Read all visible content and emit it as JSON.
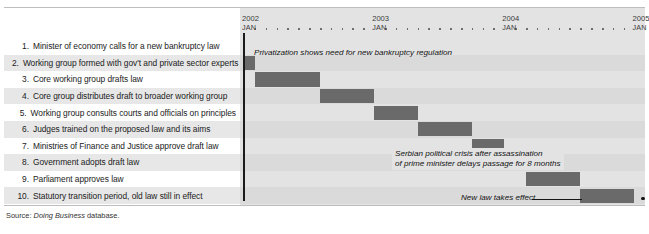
{
  "figure": {
    "source_prefix": "Source:",
    "source_italic": "Doing Business",
    "source_suffix": "database."
  },
  "steps": [
    {
      "num": "1.",
      "label": "Minister of economy calls for a new bankruptcy law"
    },
    {
      "num": "2.",
      "label": "Working group formed with gov't and private sector experts"
    },
    {
      "num": "3.",
      "label": "Core working group drafts law"
    },
    {
      "num": "4.",
      "label": "Core group distributes draft to broader working group"
    },
    {
      "num": "5.",
      "label": "Working group consults courts and officials on principles"
    },
    {
      "num": "6.",
      "label": "Judges trained on the proposed law and its aims"
    },
    {
      "num": "7.",
      "label": "Ministries of Finance and Justice approve draft law"
    },
    {
      "num": "8.",
      "label": "Government adopts draft law"
    },
    {
      "num": "9.",
      "label": "Parliament approves law"
    },
    {
      "num": "10.",
      "label": "Statutory transition period, old law still in effect"
    }
  ],
  "timeline": {
    "years": [
      {
        "year": "2002",
        "month": "JAN"
      },
      {
        "year": "2003",
        "month": "JAN"
      },
      {
        "year": "2004",
        "month": "JAN"
      },
      {
        "year": "2005",
        "month": "JAN"
      }
    ]
  },
  "annotations": {
    "privatization": "Privatization shows need for new bankruptcy regulation",
    "crisis_line1": "Serbian political crisis after assassination",
    "crisis_line2": "of prime minister delays passage for 8 months",
    "new_law": "New law takes effect"
  },
  "chart_data": {
    "type": "bar",
    "title": "",
    "subtype": "gantt",
    "xlabel": "",
    "ylabel": "",
    "grid": false,
    "legend": "none",
    "xlim": [
      "2002-01",
      "2005-01"
    ],
    "bar_color": "#6a6a6a",
    "categories": [
      "1. Minister of economy calls for a new bankruptcy law",
      "2. Working group formed with gov't and private sector experts",
      "3. Core working group drafts law",
      "4. Core group distributes draft to broader working group",
      "5. Working group consults courts and officials on principles",
      "6. Judges trained on the proposed law and its aims",
      "7. Ministries of Finance and Justice approve draft law",
      "8. Government adopts draft law",
      "9. Parliament approves law",
      "10. Statutory transition period, old law still in effect"
    ],
    "bars": [
      {
        "row": 1,
        "start_month": 0,
        "end_month": 0,
        "visible": false
      },
      {
        "row": 2,
        "start_month": 0,
        "end_month": 1,
        "visible": true
      },
      {
        "row": 3,
        "start_month": 1,
        "end_month": 7,
        "visible": true
      },
      {
        "row": 4,
        "start_month": 7,
        "end_month": 12,
        "visible": true
      },
      {
        "row": 5,
        "start_month": 12,
        "end_month": 16,
        "visible": true
      },
      {
        "row": 6,
        "start_month": 16,
        "end_month": 21,
        "visible": true
      },
      {
        "row": 7,
        "start_month": 21,
        "end_month": 24,
        "visible": true
      },
      {
        "row": 8,
        "start_month": 24,
        "end_month": 26,
        "visible": true
      },
      {
        "row": 9,
        "start_month": 26,
        "end_month": 31,
        "visible": true
      },
      {
        "row": 10,
        "start_month": 31,
        "end_month": 36,
        "visible": true
      }
    ]
  }
}
